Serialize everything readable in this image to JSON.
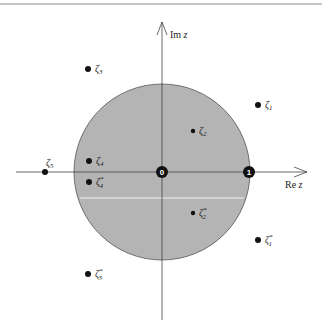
{
  "diagram": {
    "colors": {
      "disk_fill": "#b4b4b4",
      "disk_stroke": "#555555",
      "axis": "#444444",
      "point": "#111111",
      "rule": "#8a8a8a",
      "cut_line": "#f2f2f2"
    },
    "axes": {
      "real_label_prefix": "Re",
      "real_label_var": "z",
      "imag_label_prefix": "Im",
      "imag_label_var": "z"
    },
    "markers": {
      "origin_label": "0",
      "one_label": "1"
    },
    "points": [
      {
        "id": "zeta1",
        "base": "ζ",
        "sub": "1",
        "sup": ""
      },
      {
        "id": "zeta2",
        "base": "ζ",
        "sub": "2",
        "sup": ""
      },
      {
        "id": "zeta3",
        "base": "ζ",
        "sub": "3",
        "sup": ""
      },
      {
        "id": "zeta4",
        "base": "ζ",
        "sub": "4",
        "sup": ""
      },
      {
        "id": "zeta5",
        "base": "ζ",
        "sub": "5",
        "sup": ""
      },
      {
        "id": "zeta1-conj",
        "base": "ζ",
        "sub": "1",
        "sup": "*"
      },
      {
        "id": "zeta2-conj",
        "base": "ζ",
        "sub": "2",
        "sup": "*"
      },
      {
        "id": "zeta3-conj",
        "base": "ζ",
        "sub": "3",
        "sup": "*"
      },
      {
        "id": "zeta4-conj",
        "base": "ζ",
        "sub": "4",
        "sup": "*"
      }
    ]
  }
}
